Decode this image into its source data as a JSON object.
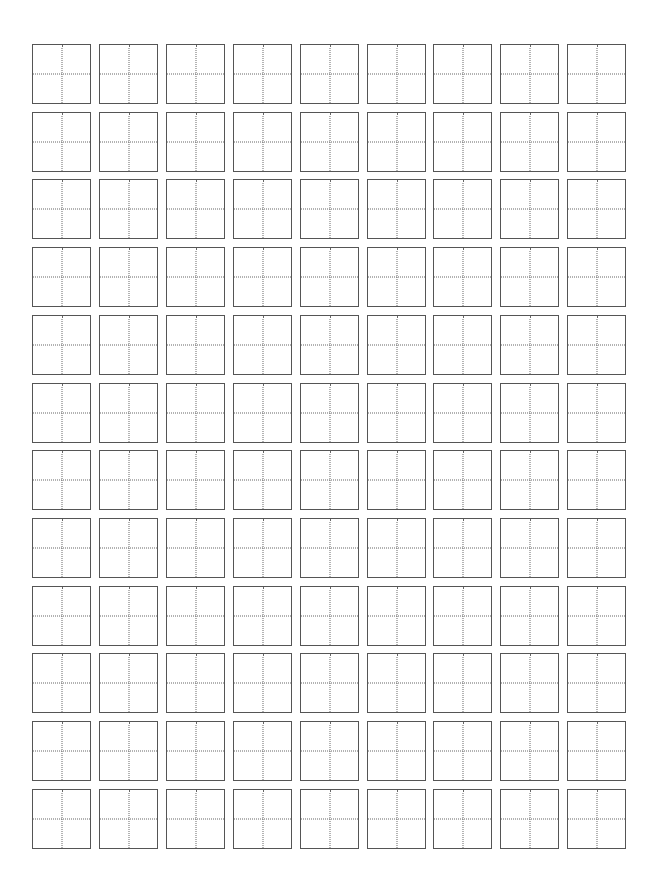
{
  "sheet": {
    "type": "tianzige-practice-grid",
    "rows": 12,
    "columns": 9,
    "cell_size_px": 60,
    "pitch_x_px": 66.9,
    "pitch_y_px": 67.7,
    "border_color": "#555555",
    "guide_color": "#666666",
    "guide_style": "dotted"
  }
}
